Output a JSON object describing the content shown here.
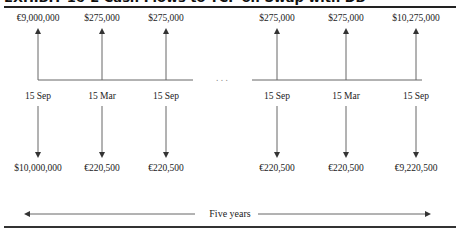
{
  "title": "EXHIBIT 16-2 Cash Flows to TCF on Swap with DB",
  "columns": [
    {
      "x": 38,
      "date": "15 Sep",
      "inflow": "€9,000,000",
      "outflow": "$10,000,000"
    },
    {
      "x": 102,
      "date": "15 Mar",
      "inflow": "$275,000",
      "outflow": "€220,500"
    },
    {
      "x": 166,
      "date": "15 Sep",
      "inflow": "$275,000",
      "outflow": "€220,500"
    },
    {
      "x": 277,
      "date": "15 Sep",
      "inflow": "$275,000",
      "outflow": "€220,500"
    },
    {
      "x": 346,
      "date": "15 Mar",
      "inflow": "$275,000",
      "outflow": "€220,500"
    },
    {
      "x": 416,
      "date": "15 Sep",
      "inflow": "$10,275,000",
      "outflow": "€9,220,500"
    }
  ],
  "ellipsis": ". . .",
  "duration_label": "Five years",
  "colors": {
    "line": "#555555",
    "text": "#222222",
    "rule": "#222222"
  }
}
